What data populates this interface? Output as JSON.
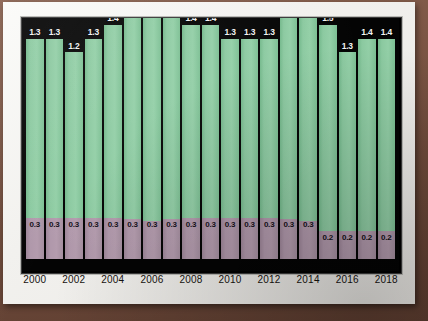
{
  "chart_data": {
    "type": "bar",
    "subtype": "stacked-bar",
    "title": "",
    "subtitle": "",
    "xlabel": "",
    "ylabel": "",
    "grid": false,
    "legend": null,
    "ylim": [
      0,
      1.75
    ],
    "stacked": true,
    "categories": [
      "2000",
      "2001",
      "2002",
      "2003",
      "2004",
      "2005",
      "2006",
      "2007",
      "2008",
      "2009",
      "2010",
      "2011",
      "2012",
      "2013",
      "2014",
      "2015",
      "2016",
      "2017",
      "2018"
    ],
    "tick_labels": [
      "2000",
      "2002",
      "2004",
      "2006",
      "2008",
      "2010",
      "2012",
      "2014",
      "2016",
      "2018"
    ],
    "series": [
      {
        "name": "upper-segment",
        "color": "#8bc9a0",
        "values": [
          1.3,
          1.3,
          1.2,
          1.3,
          1.4,
          1.5,
          1.6,
          1.5,
          1.4,
          1.4,
          1.3,
          1.3,
          1.3,
          1.5,
          1.6,
          1.5,
          1.3,
          1.4,
          1.4
        ],
        "labels": [
          "1.3",
          "1.3",
          "1.2",
          "1.3",
          "1.4",
          "1.5",
          "1.6",
          "1.5",
          "1.4",
          "1.4",
          "1.3",
          "1.3",
          "1.3",
          "1.5",
          "1.6",
          "1.5",
          "1.3",
          "1.4",
          "1.4"
        ]
      },
      {
        "name": "lower-segment",
        "color": "#b098ab",
        "values": [
          0.3,
          0.3,
          0.3,
          0.3,
          0.3,
          0.3,
          0.3,
          0.3,
          0.3,
          0.3,
          0.3,
          0.3,
          0.3,
          0.3,
          0.3,
          0.2,
          0.2,
          0.2,
          0.2
        ],
        "labels": [
          "0.3",
          "0.3",
          "0.3",
          "0.3",
          "0.3",
          "0.3",
          "0.3",
          "0.3",
          "0.3",
          "0.3",
          "0.3",
          "0.3",
          "0.3",
          "0.3",
          "0.3",
          "0.2",
          "0.2",
          "0.2",
          "0.2"
        ]
      }
    ],
    "colors": {
      "plot_background": "#040404",
      "page_background": "#f4f3f0",
      "upper_segment": "#8bc9a0",
      "lower_segment": "#b098ab",
      "upper_label_text": "#f2f2f2",
      "lower_label_text": "#141018",
      "tick_text": "#15120f"
    }
  }
}
